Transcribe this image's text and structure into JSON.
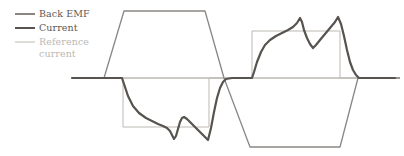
{
  "figure": {
    "title": "",
    "width": 404,
    "height": 156,
    "background": "#ffffff"
  },
  "legend": {
    "position": "top-left",
    "items": [
      {
        "label": "Back EMF",
        "color": "#8b8682",
        "width": 2.0,
        "muted": false
      },
      {
        "label": "Current",
        "color": "#57534e",
        "width": 2.6,
        "muted": false
      },
      {
        "label": "Reference current",
        "color": "#bcb9b4",
        "width": 1.4,
        "muted": true
      }
    ]
  },
  "axis": {
    "zero_line_color": "#9a9590",
    "zero_line_y": 78,
    "x_start": 72,
    "x_end": 400,
    "show_ticks": false,
    "show_grid": false,
    "xlabel": "",
    "ylabel": ""
  },
  "chart_data": {
    "type": "line",
    "title": "",
    "subtitle": "",
    "xlabel": "",
    "ylabel": "",
    "xlim": [
      0,
      404
    ],
    "ylim": [
      156,
      0
    ],
    "grid": false,
    "legend_position": "top-left",
    "annotations": [],
    "axis_zero_y": 78,
    "series": [
      {
        "name": "Back EMF",
        "color": "#8b8682",
        "width": 1.3,
        "shape": "trapezoid",
        "points": [
          [
            72,
            78
          ],
          [
            104,
            78
          ],
          [
            124,
            11
          ],
          [
            205,
            11
          ],
          [
            224,
            78
          ],
          [
            250,
            147
          ],
          [
            340,
            147
          ],
          [
            358,
            78
          ],
          [
            400,
            78
          ]
        ]
      },
      {
        "name": "Reference current",
        "color": "#bcb9b4",
        "width": 1.0,
        "shape": "rectangular-pulse",
        "points": [
          [
            72,
            78
          ],
          [
            123,
            78
          ],
          [
            123,
            127
          ],
          [
            209,
            127
          ],
          [
            209,
            78
          ],
          [
            252,
            78
          ],
          [
            252,
            31
          ],
          [
            340,
            31
          ],
          [
            340,
            78
          ],
          [
            400,
            78
          ]
        ]
      },
      {
        "name": "Current",
        "color": "#57534e",
        "width": 2.2,
        "shape": "hysteresis-ripple",
        "points": [
          [
            72,
            78
          ],
          [
            85,
            78
          ],
          [
            110,
            78
          ],
          [
            122,
            78
          ],
          [
            124,
            84
          ],
          [
            128,
            96
          ],
          [
            133,
            106
          ],
          [
            139,
            113
          ],
          [
            146,
            118
          ],
          [
            152,
            121
          ],
          [
            158,
            124
          ],
          [
            163,
            126
          ],
          [
            167,
            128
          ],
          [
            170,
            131
          ],
          [
            172,
            135
          ],
          [
            174,
            139
          ],
          [
            176,
            136
          ],
          [
            178,
            129
          ],
          [
            180,
            122
          ],
          [
            182,
            118
          ],
          [
            184,
            117
          ],
          [
            187,
            119
          ],
          [
            191,
            123
          ],
          [
            196,
            128
          ],
          [
            201,
            133
          ],
          [
            205,
            137
          ],
          [
            208,
            140
          ],
          [
            211,
            128
          ],
          [
            214,
            112
          ],
          [
            217,
            98
          ],
          [
            220,
            88
          ],
          [
            223,
            82
          ],
          [
            226,
            79
          ],
          [
            232,
            78
          ],
          [
            250,
            78
          ],
          [
            252,
            78
          ],
          [
            254,
            72
          ],
          [
            257,
            62
          ],
          [
            261,
            52
          ],
          [
            265,
            45
          ],
          [
            270,
            40
          ],
          [
            276,
            36
          ],
          [
            282,
            33
          ],
          [
            288,
            30
          ],
          [
            293,
            27
          ],
          [
            297,
            23
          ],
          [
            300,
            18
          ],
          [
            302,
            22
          ],
          [
            304,
            30
          ],
          [
            307,
            38
          ],
          [
            310,
            44
          ],
          [
            313,
            48
          ],
          [
            316,
            45
          ],
          [
            320,
            40
          ],
          [
            325,
            34
          ],
          [
            330,
            28
          ],
          [
            335,
            22
          ],
          [
            338,
            17
          ],
          [
            341,
            24
          ],
          [
            344,
            36
          ],
          [
            347,
            50
          ],
          [
            350,
            62
          ],
          [
            353,
            70
          ],
          [
            356,
            75
          ],
          [
            359,
            78
          ],
          [
            375,
            78
          ],
          [
            395,
            78
          ]
        ]
      }
    ]
  }
}
